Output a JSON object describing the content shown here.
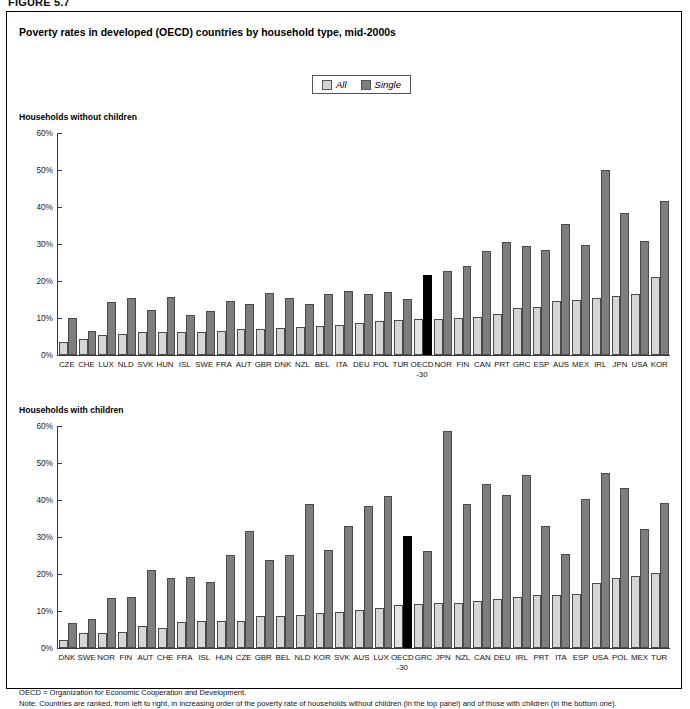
{
  "figure_label": "FIGURE 5.7",
  "title": "Poverty rates in developed (OECD) countries by household type, mid-2000s",
  "legend": {
    "all_label": "All",
    "single_label": "Single",
    "all_color": "#d6d6d6",
    "single_color": "#7e7e7e",
    "highlight_color": "#000000"
  },
  "panels": {
    "top_label": "Households without children",
    "bottom_label": "Households with children"
  },
  "footnotes": {
    "line1": "OECD = Organization for Economic Cooperation and Development.",
    "line2": "Note: Countries are ranked, from left to right, in increasing order of the poverty rate of households without children (in the top panel) and of those with children (in the bottom one)."
  },
  "chart_data": [
    {
      "type": "bar",
      "title": "Households without children",
      "xlabel": "",
      "ylabel": "",
      "ylim": [
        0,
        60
      ],
      "ytick_labels": [
        "60%",
        "50%",
        "40%",
        "30%",
        "20%",
        "10%",
        "0%"
      ],
      "ytick_values": [
        60,
        50,
        40,
        30,
        20,
        10,
        0
      ],
      "grid": false,
      "legend_position": "top-center",
      "categories": [
        "CZE",
        "CHE",
        "LUX",
        "NLD",
        "SVK",
        "HUN",
        "ISL",
        "SWE",
        "FRA",
        "AUT",
        "GBR",
        "DNK",
        "NZL",
        "BEL",
        "ITA",
        "DEU",
        "POL",
        "TUR",
        "OECD-30",
        "NOR",
        "FIN",
        "CAN",
        "PRT",
        "GRC",
        "ESP",
        "AUS",
        "MEX",
        "IRL",
        "JPN",
        "USA",
        "KOR"
      ],
      "highlight_category": "OECD-30",
      "series": [
        {
          "name": "All",
          "values": [
            3.6,
            4.4,
            5.3,
            5.7,
            6.2,
            6.3,
            6.1,
            6.2,
            6.6,
            6.9,
            7.0,
            7.2,
            7.5,
            7.8,
            8.1,
            8.6,
            9.1,
            9.4,
            9.6,
            9.7,
            10.0,
            10.2,
            11.1,
            12.6,
            13.0,
            14.7,
            14.8,
            15.5,
            16.0,
            16.5,
            21.2
          ]
        },
        {
          "name": "Single",
          "values": [
            10.0,
            6.5,
            14.2,
            15.4,
            12.2,
            15.6,
            10.9,
            12.0,
            14.6,
            13.9,
            16.8,
            15.3,
            13.9,
            16.4,
            17.4,
            16.6,
            17.0,
            15.1,
            21.7,
            22.6,
            24.0,
            28.0,
            30.5,
            29.4,
            28.4,
            35.5,
            29.8,
            50.0,
            38.3,
            30.9,
            41.5
          ]
        }
      ]
    },
    {
      "type": "bar",
      "title": "Households with children",
      "xlabel": "",
      "ylabel": "",
      "ylim": [
        0,
        60
      ],
      "ytick_labels": [
        "60%",
        "50%",
        "40%",
        "30%",
        "20%",
        "10%",
        "0%"
      ],
      "ytick_values": [
        60,
        50,
        40,
        30,
        20,
        10,
        0
      ],
      "grid": false,
      "legend_position": "top-center",
      "categories": [
        "DNK",
        "SWE",
        "NOR",
        "FIN",
        "AUT",
        "CHE",
        "FRA",
        "ISL",
        "HUN",
        "CZE",
        "GBR",
        "BEL",
        "NLD",
        "KOR",
        "SVK",
        "AUS",
        "LUX",
        "OECD-30",
        "GRC",
        "JPN",
        "NZL",
        "CAN",
        "DEU",
        "IRL",
        "PRT",
        "ITA",
        "ESP",
        "USA",
        "POL",
        "MEX",
        "TUR"
      ],
      "highlight_category": "OECD-30",
      "series": [
        {
          "name": "All",
          "values": [
            2.2,
            4.0,
            4.0,
            4.2,
            5.9,
            5.5,
            7.0,
            7.2,
            7.2,
            7.3,
            8.6,
            8.6,
            9.0,
            9.5,
            9.8,
            10.3,
            10.9,
            11.7,
            11.9,
            12.3,
            12.2,
            12.8,
            13.2,
            13.9,
            14.3,
            14.4,
            14.5,
            17.6,
            19.0,
            19.5,
            20.3
          ]
        },
        {
          "name": "Single",
          "values": [
            6.8,
            7.8,
            13.4,
            13.7,
            21.1,
            18.8,
            19.2,
            17.9,
            25.1,
            31.7,
            23.8,
            25.1,
            38.9,
            26.4,
            33.0,
            38.4,
            41.1,
            30.3,
            26.2,
            58.7,
            38.8,
            44.4,
            41.4,
            46.7,
            33.0,
            25.3,
            40.4,
            47.2,
            43.2,
            32.3,
            39.3
          ]
        }
      ]
    }
  ]
}
